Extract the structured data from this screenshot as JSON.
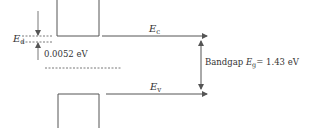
{
  "diagram": {
    "type": "energy-band-diagram",
    "colors": {
      "line": "#555555",
      "text": "#333333",
      "background": "#ffffff"
    },
    "labels": {
      "conduction_band": {
        "symbol": "E",
        "subscript": "c"
      },
      "valence_band": {
        "symbol": "E",
        "subscript": "v"
      },
      "donor_level": {
        "symbol": "E",
        "subscript": "d"
      },
      "donor_energy": "0.0052 eV",
      "bandgap": {
        "prefix": "Bandgap ",
        "symbol": "E",
        "subscript": "g",
        "value": "= 1.43 eV"
      }
    }
  }
}
